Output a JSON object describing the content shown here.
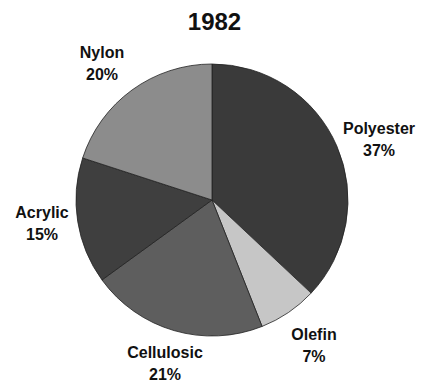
{
  "chart_data": {
    "type": "pie",
    "title": "1982",
    "categories": [
      "Polyester",
      "Olefin",
      "Cellulosic",
      "Acrylic",
      "Nylon"
    ],
    "values": [
      37,
      7,
      21,
      15,
      20
    ],
    "colors": [
      "#3a3a3a",
      "#c6c6c6",
      "#5e5e5e",
      "#3f3f3f",
      "#8c8c8c"
    ],
    "start_angle_deg": 90,
    "direction": "clockwise",
    "labels": [
      {
        "name": "Polyester",
        "pct": "37%"
      },
      {
        "name": "Olefin",
        "pct": "7%"
      },
      {
        "name": "Cellulosic",
        "pct": "21%"
      },
      {
        "name": "Acrylic",
        "pct": "15%"
      },
      {
        "name": "Nylon",
        "pct": "20%"
      }
    ]
  }
}
